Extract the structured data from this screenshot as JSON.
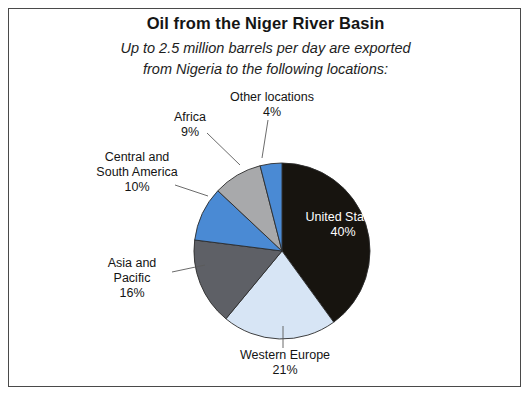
{
  "figure": {
    "title": "Oil from the Niger River Basin",
    "subtitle_line1": "Up to 2.5 million barrels per day are exported",
    "subtitle_line2": "from Nigeria to the following locations:"
  },
  "labels": {
    "united_states": {
      "name": "United States",
      "pct": "40%"
    },
    "western_europe": {
      "name": "Western Europe",
      "pct": "21%"
    },
    "asia_pacific_line1": "Asia and",
    "asia_pacific_line2": "Pacific",
    "asia_pacific_pct": "16%",
    "central_south_america_line1": "Central and",
    "central_south_america_line2": "South America",
    "central_south_america_pct": "10%",
    "africa": {
      "name": "Africa",
      "pct": "9%"
    },
    "other_locations": {
      "name": "Other locations",
      "pct": "4%"
    }
  },
  "chart_data": {
    "type": "pie",
    "title": "Oil from the Niger River Basin",
    "subtitle": "Up to 2.5 million barrels per day are exported from Nigeria to the following locations:",
    "unit": "percent of exported barrels",
    "total_label": "Up to 2.5 million barrels per day",
    "start_angle_deg": 0,
    "direction": "clockwise",
    "center": {
      "x": 282,
      "y": 251
    },
    "radius": 88,
    "legend": "none (direct labels with leader lines)",
    "categories": [
      "United States",
      "Western Europe",
      "Asia and Pacific",
      "Central and South America",
      "Africa",
      "Other locations"
    ],
    "values": [
      40,
      21,
      16,
      10,
      9,
      4
    ],
    "colors": [
      "#17140f",
      "#d7e5f5",
      "#5e6066",
      "#4a8ad4",
      "#a8a9ab",
      "#4a8ad4"
    ],
    "slices": [
      {
        "label": "United States",
        "value": 40,
        "color": "#17140f",
        "label_placement": "inside",
        "label_color": "#ffffff"
      },
      {
        "label": "Western Europe",
        "value": 21,
        "color": "#d7e5f5",
        "label_placement": "outside-bottom"
      },
      {
        "label": "Asia and Pacific",
        "value": 16,
        "color": "#5e6066",
        "label_placement": "outside-left"
      },
      {
        "label": "Central and South America",
        "value": 10,
        "color": "#4a8ad4",
        "label_placement": "outside-left"
      },
      {
        "label": "Africa",
        "value": 9,
        "color": "#a8a9ab",
        "label_placement": "outside-top-left"
      },
      {
        "label": "Other locations",
        "value": 4,
        "color": "#4a8ad4",
        "label_placement": "outside-top"
      }
    ],
    "stroke_color": "#2b2b2b",
    "background": "#ffffff",
    "border_color": "#4a4a4a"
  }
}
